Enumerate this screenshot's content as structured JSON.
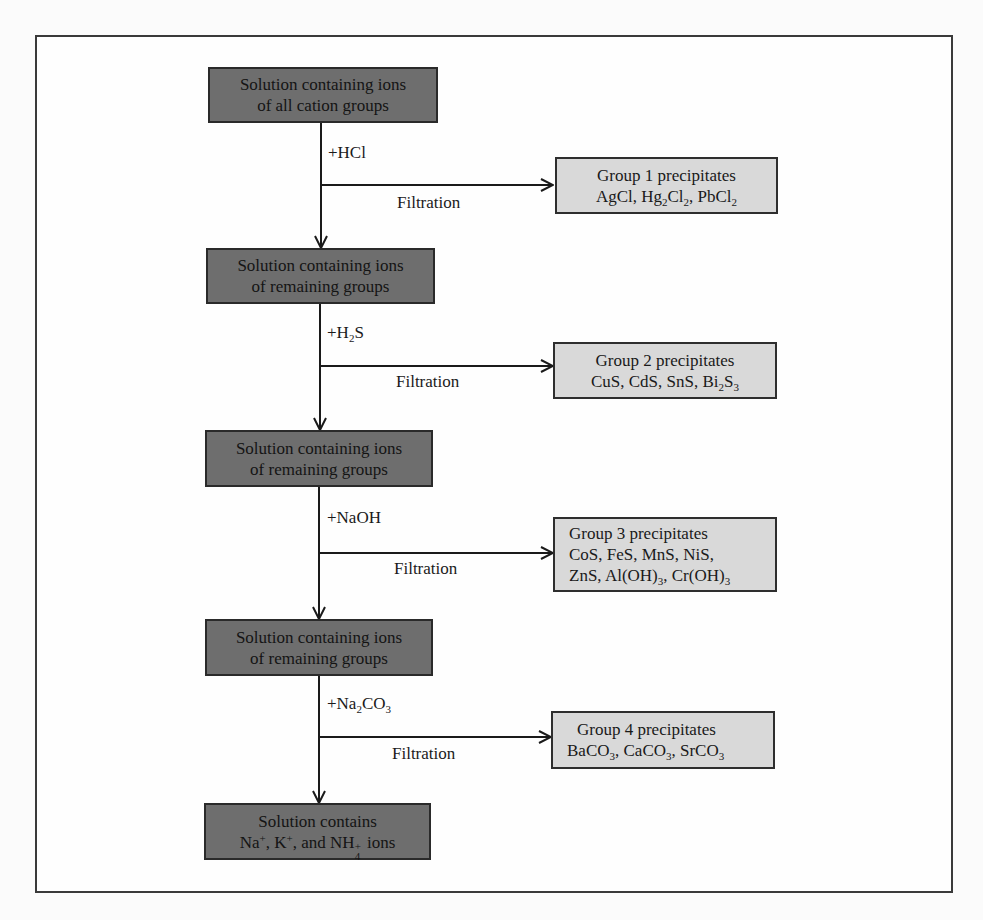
{
  "diagram": {
    "solution_boxes": [
      {
        "line1": "Solution containing ions",
        "line2": "of all cation groups"
      },
      {
        "line1": "Solution containing ions",
        "line2": "of remaining groups"
      },
      {
        "line1": "Solution containing ions",
        "line2": "of remaining groups"
      },
      {
        "line1": "Solution containing ions",
        "line2": "of remaining groups"
      },
      {
        "line1": "Solution contains",
        "line2_parts": {
          "na": "Na",
          "na_sup": "+",
          "sep1": ", K",
          "k_sup": "+",
          "sep2": ", and NH",
          "nh_sub": "4",
          "nh_sup": "+",
          "tail": " ions"
        }
      }
    ],
    "reagents": [
      {
        "prefix": "+HCl",
        "sub": "",
        "suffix": ""
      },
      {
        "prefix": "+H",
        "sub": "2",
        "suffix": "S"
      },
      {
        "prefix": "+NaOH",
        "sub": "",
        "suffix": ""
      },
      {
        "prefix": "+Na",
        "sub": "2",
        "suffix": "CO",
        "sub2": "3"
      }
    ],
    "filtration_label": "Filtration",
    "precipitate_groups": [
      {
        "title": "Group 1 precipitates",
        "compounds": [
          "AgCl",
          "Hg2Cl2",
          "PbCl2"
        ]
      },
      {
        "title": "Group 2 precipitates",
        "compounds": [
          "CuS",
          "CdS",
          "SnS",
          "Bi2S3"
        ]
      },
      {
        "title": "Group 3 precipitates",
        "compounds": [
          "CoS",
          "FeS",
          "MnS",
          "NiS",
          "ZnS",
          "Al(OH)3",
          "Cr(OH)3"
        ]
      },
      {
        "title": "Group 4 precipitates",
        "compounds": [
          "BaCO3",
          "CaCO3",
          "SrCO3"
        ]
      }
    ],
    "g1": {
      "a": "AgCl, Hg",
      "a_sub": "2",
      "b": "Cl",
      "b_sub": "2",
      "c": ", PbCl",
      "c_sub": "2"
    },
    "g2": {
      "a": "CuS, CdS, SnS, Bi",
      "a_sub": "2",
      "b": "S",
      "b_sub": "3"
    },
    "g3": {
      "l2": "CoS, FeS, MnS, NiS,",
      "a": "ZnS, Al(OH)",
      "a_sub": "3",
      "b": ", Cr(OH)",
      "b_sub": "3"
    },
    "g4": {
      "a": "BaCO",
      "a_sub": "3",
      "b": ", CaCO",
      "b_sub": "3",
      "c": ", SrCO",
      "c_sub": "3"
    },
    "colors": {
      "solution_box": "#6e6e6e",
      "precipitate_box": "#d9d9d9",
      "line": "#1a1a1a"
    }
  }
}
